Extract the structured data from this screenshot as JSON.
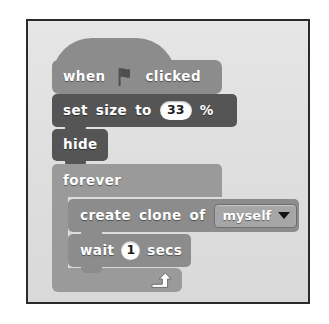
{
  "figure": {
    "kind": "scratch-script",
    "frame_border_color": "#2b2b2b",
    "canvas_color": "#e1e1e1"
  },
  "script": {
    "blocks": [
      {
        "id": "when-flag-clicked",
        "type": "hat",
        "color": "#8c8c8c",
        "text_before": "when",
        "icon": "green-flag-icon",
        "text_after": "clicked"
      },
      {
        "id": "set-size-to",
        "type": "stack",
        "color": "#555555",
        "label_1": "set",
        "label_2": "size",
        "label_3": "to",
        "value": "33",
        "unit": "%"
      },
      {
        "id": "hide",
        "type": "stack",
        "color": "#555555",
        "label": "hide"
      },
      {
        "id": "forever",
        "type": "c-block",
        "color": "#9a9a9a",
        "label": "forever",
        "loop_arrow": "loop-arrow-icon",
        "children": [
          {
            "id": "create-clone-of",
            "type": "stack",
            "color": "#8c8c8c",
            "label_1": "create",
            "label_2": "clone",
            "label_3": "of",
            "dropdown_value": "myself",
            "dropdown_caret": "chevron-down-icon"
          },
          {
            "id": "wait-secs",
            "type": "stack",
            "color": "#8c8c8c",
            "label_1": "wait",
            "value": "1",
            "label_2": "secs"
          }
        ]
      }
    ]
  }
}
